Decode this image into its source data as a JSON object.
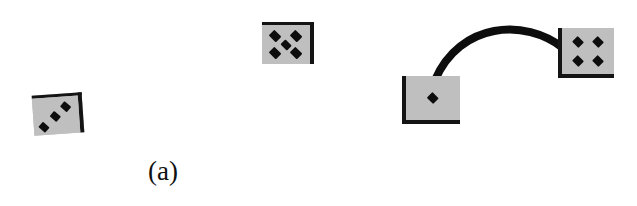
{
  "figure": {
    "background_color": "#ffffff",
    "width": 637,
    "height": 206,
    "die_face_color": "#bfbfbf",
    "pip_color": "#0d0d0d",
    "edge_color": "#141414",
    "connector_color": "#0d0d0d"
  },
  "panels": [
    {
      "id": "a",
      "label": "(a)",
      "connected": false,
      "objects": [
        {
          "name": "die-three-pips",
          "pip_count": 3,
          "pip_layout": "diagonal",
          "x": 33,
          "y": 94,
          "width": 50,
          "height": 40,
          "rotation_deg": -4,
          "shaded_edges": "top-right",
          "pips": [
            {
              "cx": 22,
              "cy": 78,
              "size": 17
            },
            {
              "cx": 48,
              "cy": 52,
              "size": 17
            },
            {
              "cx": 72,
              "cy": 26,
              "size": 17
            }
          ]
        },
        {
          "name": "die-five-pips",
          "pip_count": 5,
          "pip_layout": "quincunx",
          "x": 262,
          "y": 22,
          "width": 52,
          "height": 42,
          "rotation_deg": 0,
          "shaded_edges": "top-right",
          "pips": [
            {
              "cx": 28,
              "cy": 27,
              "size": 19
            },
            {
              "cx": 70,
              "cy": 27,
              "size": 19
            },
            {
              "cx": 49,
              "cy": 50,
              "size": 17
            },
            {
              "cx": 28,
              "cy": 72,
              "size": 19
            },
            {
              "cx": 70,
              "cy": 72,
              "size": 19
            }
          ]
        }
      ]
    },
    {
      "id": "b",
      "label": "(b)",
      "connected": true,
      "objects": [
        {
          "name": "die-one-pip",
          "pip_count": 1,
          "pip_layout": "center",
          "x": 82,
          "y": 76,
          "width": 58,
          "height": 48,
          "rotation_deg": 0,
          "shaded_edges": "bottom-left",
          "pips": [
            {
              "cx": 50,
              "cy": 50,
              "size": 16
            }
          ]
        },
        {
          "name": "die-four-pips",
          "pip_count": 4,
          "pip_layout": "square",
          "x": 238,
          "y": 28,
          "width": 56,
          "height": 50,
          "rotation_deg": 0,
          "shaded_edges": "bottom-left",
          "pips": [
            {
              "cx": 31,
              "cy": 31,
              "size": 16
            },
            {
              "cx": 70,
              "cy": 31,
              "size": 16
            },
            {
              "cx": 31,
              "cy": 71,
              "size": 16
            },
            {
              "cx": 70,
              "cy": 71,
              "size": 16
            }
          ]
        }
      ],
      "connector": {
        "name": "connector-arc",
        "description": "thick black curved link joining the one-pip die to the four-pip die",
        "stroke_width": 8,
        "start": {
          "x": 115,
          "y": 80
        },
        "control_1": {
          "x": 140,
          "y": 22
        },
        "control_2": {
          "x": 205,
          "y": 18
        },
        "end": {
          "x": 243,
          "y": 48
        }
      }
    }
  ]
}
